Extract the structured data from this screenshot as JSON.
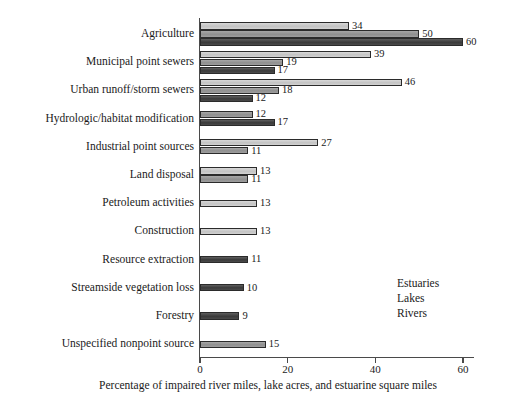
{
  "chart_data": {
    "type": "bar",
    "orientation": "horizontal",
    "title": "",
    "xlabel": "Percentage of impaired river miles, lake acres, and estuarine square miles",
    "ylabel": "",
    "xlim": [
      0,
      60
    ],
    "xticks": [
      0,
      20,
      40,
      60
    ],
    "xtick_labels": [
      "0",
      "20",
      "40",
      "60"
    ],
    "grid": false,
    "legend_position": "center-right",
    "categories": [
      "Agriculture",
      "Municipal point sewers",
      "Urban runoff/storm sewers",
      "Hydrologic/habitat modification",
      "Industrial point sources",
      "Land disposal",
      "Petroleum activities",
      "Construction",
      "Resource extraction",
      "Streamside vegetation loss",
      "Forestry",
      "Unspecified nonpoint source"
    ],
    "series": [
      {
        "name": "Estuaries",
        "color": "#cccccc",
        "values": [
          34,
          39,
          46,
          null,
          27,
          13,
          13,
          13,
          null,
          null,
          null,
          null
        ]
      },
      {
        "name": "Lakes",
        "color": "#999999",
        "values": [
          50,
          19,
          18,
          12,
          11,
          11,
          null,
          null,
          null,
          null,
          null,
          15
        ]
      },
      {
        "name": "Rivers",
        "color": "#404040",
        "values": [
          60,
          17,
          12,
          17,
          null,
          null,
          null,
          null,
          11,
          10,
          9,
          null
        ]
      }
    ],
    "legend": [
      {
        "label": "Estuaries",
        "swatch": "estuaries"
      },
      {
        "label": "Lakes",
        "swatch": "lakes"
      },
      {
        "label": "Rivers",
        "swatch": "rivers"
      }
    ]
  }
}
